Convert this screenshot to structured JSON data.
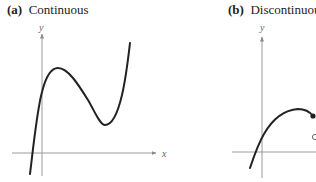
{
  "figure": {
    "panels": [
      {
        "id": "a",
        "label": "(a)",
        "title": "Continuous",
        "x_axis_label": "x",
        "y_axis_label": "y",
        "description": "Cubic-like continuous curve: rises from below x-axis, crosses y-axis, local maximum, local minimum, then rises steeply"
      },
      {
        "id": "b",
        "label": "(b)",
        "title": "Discontinuous",
        "y_axis_label": "y",
        "description": "Curve rising from below x-axis to a maximum then ending at a filled dot; an open circle below indicates a jump discontinuity (cropped at right edge)"
      }
    ],
    "colors": {
      "curve": "#222222",
      "axis": "#9a9a9a",
      "text": "#222222"
    }
  }
}
